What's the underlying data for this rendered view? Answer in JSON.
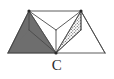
{
  "figure": {
    "label": "C",
    "caption_label": "C",
    "canvas": {
      "width": 114,
      "height": 79
    },
    "background_color": "#ffffff",
    "stroke_color": "#4a4a4a",
    "stroke_width": 0.9,
    "shaded_face_color": "#6e6e6e",
    "stippled_face_color": "#cfcfcf",
    "vertices": {
      "top_left": {
        "x": 29,
        "y": 11
      },
      "top_right": {
        "x": 81,
        "y": 11
      },
      "bottom_left": {
        "x": 8,
        "y": 53
      },
      "bottom_right": {
        "x": 105,
        "y": 53
      },
      "bottom_center": {
        "x": 56,
        "y": 53
      },
      "inner_apex": {
        "x": 56,
        "y": 30
      },
      "left_mid": {
        "x": 29,
        "y": 30
      },
      "right_mid": {
        "x": 81,
        "y": 30
      }
    },
    "edges": [
      {
        "name": "top-ridge",
        "from": "top_left",
        "to": "top_right"
      },
      {
        "name": "baseline",
        "from": "bottom_left",
        "to": "bottom_right"
      },
      {
        "name": "left-outer-slope",
        "from": "top_left",
        "to": "bottom_left"
      },
      {
        "name": "right-outer-slope",
        "from": "top_right",
        "to": "bottom_right"
      },
      {
        "name": "left-vertical",
        "from": "top_left",
        "to": "left_mid"
      },
      {
        "name": "right-vertical",
        "from": "top_right",
        "to": "right_mid"
      },
      {
        "name": "inner-vertical",
        "from": "inner_apex",
        "to": "bottom_center"
      },
      {
        "name": "left-inner-diagonal",
        "from": "top_left",
        "to": "inner_apex"
      },
      {
        "name": "right-inner-diagonal",
        "from": "top_right",
        "to": "inner_apex"
      },
      {
        "name": "left-mid-to-center",
        "from": "left_mid",
        "to": "bottom_center"
      },
      {
        "name": "right-mid-to-center",
        "from": "right_mid",
        "to": "bottom_center"
      },
      {
        "name": "left-apex-to-center",
        "from": "top_left",
        "to": "bottom_center"
      },
      {
        "name": "right-apex-to-center",
        "from": "top_right",
        "to": "bottom_center"
      },
      {
        "name": "left-corner-to-apex",
        "from": "bottom_left",
        "to": "inner_apex"
      },
      {
        "name": "right-corner-to-apex",
        "from": "bottom_right",
        "to": "inner_apex"
      }
    ],
    "faces": [
      {
        "name": "shaded-left-face",
        "fill_style": "solid-gray",
        "points": "8,53 56,53 29,30 29,11"
      },
      {
        "name": "stippled-right-face",
        "fill_style": "dotted-stipple",
        "points": "81,11 81,30 56,53"
      }
    ]
  }
}
